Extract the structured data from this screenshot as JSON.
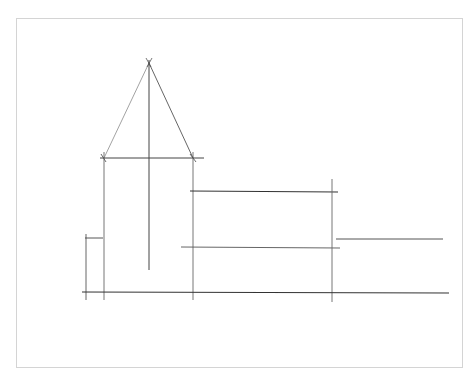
{
  "drawing": {
    "subject": "pencil line sketch of a church with spire and nave",
    "background_color": "#ffffff",
    "frame_color": "#d4d4d4",
    "stroke_color": "#3a3a3a",
    "light_stroke_color": "#7a7a7a"
  }
}
